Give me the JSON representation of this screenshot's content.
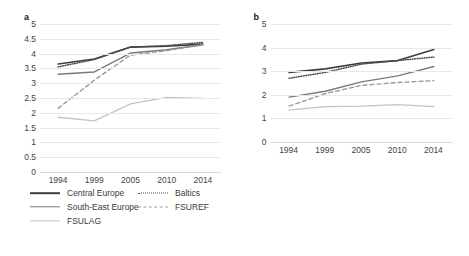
{
  "chart_data": [
    {
      "type": "line",
      "panel": "a",
      "title": "a",
      "xlabel": "",
      "ylabel": "",
      "x": [
        1994,
        1999,
        2005,
        2010,
        2014
      ],
      "xtick_labels": [
        "1994",
        "1999",
        "2005",
        "2010",
        "2014"
      ],
      "ylim": [
        0,
        5
      ],
      "yticks": [
        0,
        0.5,
        1,
        1.5,
        2,
        2.5,
        3,
        3.5,
        4,
        4.5,
        5
      ],
      "ytick_labels": [
        "0",
        "0.5",
        "1",
        "1.5",
        "2",
        "2.5",
        "3",
        "3.5",
        "4",
        "4.5",
        "5"
      ],
      "grid": true,
      "legend_position": "below",
      "series": [
        {
          "name": "Central Europe",
          "style": "solid-dark",
          "color": "#3f3f3f",
          "values": [
            3.65,
            3.82,
            4.22,
            4.25,
            4.32
          ]
        },
        {
          "name": "Baltics",
          "style": "dotted",
          "color": "#4a4a4a",
          "values": [
            3.55,
            3.8,
            4.22,
            4.27,
            4.38
          ]
        },
        {
          "name": "South-East Europe",
          "style": "solid-medium",
          "color": "#7a7a7a",
          "values": [
            3.3,
            3.38,
            4.02,
            4.13,
            4.3
          ]
        },
        {
          "name": "FSUREF",
          "style": "dashed",
          "color": "#9a9a9a",
          "values": [
            2.15,
            3.1,
            3.95,
            4.1,
            4.3
          ]
        },
        {
          "name": "FSULAG",
          "style": "solid-light",
          "color": "#c4c4c4",
          "values": [
            1.85,
            1.73,
            2.3,
            2.52,
            2.49
          ]
        }
      ]
    },
    {
      "type": "line",
      "panel": "b",
      "title": "b",
      "xlabel": "",
      "ylabel": "",
      "x": [
        1994,
        1999,
        2005,
        2010,
        2014
      ],
      "xtick_labels": [
        "1994",
        "1999",
        "2005",
        "2010",
        "2014"
      ],
      "ylim": [
        0,
        5
      ],
      "yticks": [
        0,
        1,
        2,
        3,
        4,
        5
      ],
      "ytick_labels": [
        "0",
        "1",
        "2",
        "3",
        "4",
        "5"
      ],
      "grid": true,
      "legend_position": "below",
      "series": [
        {
          "name": "Central Europe",
          "style": "solid-dark",
          "color": "#3f3f3f",
          "values": [
            2.95,
            3.1,
            3.35,
            3.45,
            3.92
          ]
        },
        {
          "name": "Baltics",
          "style": "dotted",
          "color": "#4a4a4a",
          "values": [
            2.7,
            2.95,
            3.3,
            3.45,
            3.6
          ]
        },
        {
          "name": "South-East Europe",
          "style": "solid-medium",
          "color": "#7a7a7a",
          "values": [
            1.9,
            2.15,
            2.55,
            2.8,
            3.2
          ]
        },
        {
          "name": "FSUREF",
          "style": "dashed",
          "color": "#9a9a9a",
          "values": [
            1.52,
            2.05,
            2.4,
            2.52,
            2.6
          ]
        },
        {
          "name": "FSULAG",
          "style": "solid-light",
          "color": "#c4c4c4",
          "values": [
            1.35,
            1.5,
            1.52,
            1.58,
            1.5
          ]
        }
      ]
    }
  ],
  "panel_a": {
    "label": "a",
    "ytick_labels": [
      "5",
      "4.5",
      "4",
      "3.5",
      "3",
      "2.5",
      "2",
      "1.5",
      "1",
      "0.5",
      "0"
    ],
    "xtick_labels": [
      "1994",
      "1999",
      "2005",
      "2010",
      "2014"
    ],
    "legend": [
      {
        "label": "Central Europe"
      },
      {
        "label": "Baltics"
      },
      {
        "label": "South-East Europe"
      },
      {
        "label": "FSUREF"
      },
      {
        "label": "FSULAG"
      }
    ]
  },
  "panel_b": {
    "label": "b",
    "ytick_labels": [
      "5",
      "4",
      "3",
      "2",
      "1",
      "0"
    ],
    "xtick_labels": [
      "1994",
      "1999",
      "2005",
      "2010",
      "2014"
    ],
    "legend": [
      {
        "label": "Central Europe"
      },
      {
        "label": "Baltics"
      },
      {
        "label": "South-East Europe"
      },
      {
        "label": "FSUREF"
      },
      {
        "label": "FSULAG"
      }
    ]
  },
  "colors": {
    "central_europe": "#3f3f3f",
    "baltics": "#4a4a4a",
    "south_east_europe": "#7a7a7a",
    "fsuref": "#9a9a9a",
    "fsulag": "#c4c4c4",
    "grid": "#e8e8e8",
    "text": "#444444",
    "background": "#ffffff"
  }
}
